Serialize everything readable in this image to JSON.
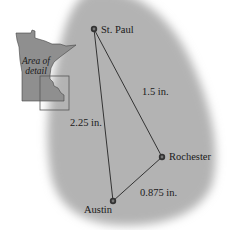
{
  "figure": {
    "background_color": "#ffffff",
    "region_color": "#b3b3b3",
    "line_color": "#333333",
    "state_fill": "#8f8f8f",
    "inset": {
      "label_line1": "Area of",
      "label_line2": "detail"
    },
    "cities": [
      {
        "name": "St. Paul",
        "x": 94,
        "y": 29
      },
      {
        "name": "Rochester",
        "x": 162,
        "y": 157
      },
      {
        "name": "Austin",
        "x": 113,
        "y": 201
      }
    ],
    "distances": [
      {
        "from": "St. Paul",
        "to": "Rochester",
        "label": "1.5 in."
      },
      {
        "from": "St. Paul",
        "to": "Austin",
        "label": "2.25 in."
      },
      {
        "from": "Rochester",
        "to": "Austin",
        "label": "0.875 in."
      }
    ]
  }
}
